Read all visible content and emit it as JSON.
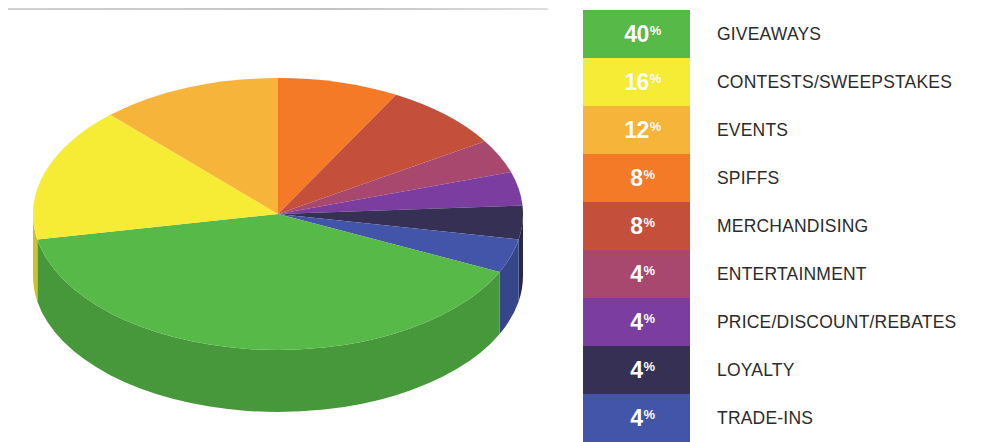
{
  "chart_data": {
    "type": "pie",
    "title": "",
    "subtitle": "",
    "xlabel": "",
    "ylabel": "",
    "legend_position": "right",
    "grid": false,
    "three_d": true,
    "start_angle_deg": 0,
    "direction": "clockwise",
    "categories": [
      "GIVEAWAYS",
      "CONTESTS/SWEEPSTAKES",
      "EVENTS",
      "SPIFFS",
      "MERCHANDISING",
      "ENTERTAINMENT",
      "PRICE/DISCOUNT/REBATES",
      "LOYALTY",
      "TRADE-INS"
    ],
    "values": [
      40,
      16,
      12,
      8,
      8,
      4,
      4,
      4,
      4
    ],
    "value_labels": [
      "40%",
      "16%",
      "12%",
      "8%",
      "8%",
      "4%",
      "4%",
      "4%",
      "4%"
    ],
    "colors": [
      "#57b947",
      "#f6ec36",
      "#f6b43a",
      "#f47a28",
      "#c4503c",
      "#a9486f",
      "#7b3da0",
      "#363054",
      "#4355a8"
    ],
    "units": "percent",
    "total": 100,
    "slice_order_clockwise_from_top": [
      "SPIFFS",
      "MERCHANDISING",
      "ENTERTAINMENT",
      "PRICE/DISCOUNT/REBATES",
      "LOYALTY",
      "TRADE-INS",
      "GIVEAWAYS",
      "CONTESTS/SWEEPSTAKES",
      "EVENTS"
    ]
  },
  "legend": {
    "rows": [
      {
        "percent": "40",
        "symbol": "%",
        "label": "GIVEAWAYS",
        "color": "#57b947",
        "side_color": "#3f9c33",
        "text_color": "#ffffff"
      },
      {
        "percent": "16",
        "symbol": "%",
        "label": "CONTESTS/SWEEPSTAKES",
        "color": "#f6ec36",
        "side_color": "#d9ce25",
        "text_color": "#ffffff"
      },
      {
        "percent": "12",
        "symbol": "%",
        "label": "EVENTS",
        "color": "#f6b43a",
        "side_color": "#d9992a",
        "text_color": "#ffffff"
      },
      {
        "percent": "8",
        "symbol": "%",
        "label": "SPIFFS",
        "color": "#f47a28",
        "side_color": "#d6631b",
        "text_color": "#ffffff"
      },
      {
        "percent": "8",
        "symbol": "%",
        "label": "MERCHANDISING",
        "color": "#c4503c",
        "side_color": "#a63f2f",
        "text_color": "#ffffff"
      },
      {
        "percent": "4",
        "symbol": "%",
        "label": "ENTERTAINMENT",
        "color": "#a9486f",
        "side_color": "#8d3a5c",
        "text_color": "#ffffff"
      },
      {
        "percent": "4",
        "symbol": "%",
        "label": "PRICE/DISCOUNT/REBATES",
        "color": "#7b3da0",
        "side_color": "#642f83",
        "text_color": "#ffffff"
      },
      {
        "percent": "4",
        "symbol": "%",
        "label": "LOYALTY",
        "color": "#363054",
        "side_color": "#282442",
        "text_color": "#ffffff"
      },
      {
        "percent": "4",
        "symbol": "%",
        "label": "TRADE-INS",
        "color": "#4355a8",
        "side_color": "#35458c",
        "text_color": "#ffffff"
      }
    ]
  },
  "divider": {
    "color": "#c4c4c4"
  }
}
